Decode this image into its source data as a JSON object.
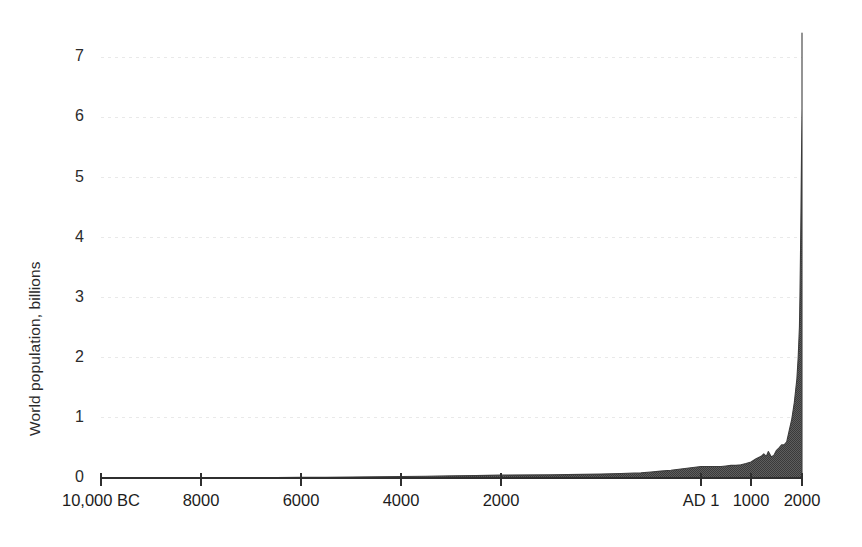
{
  "chart_data": {
    "type": "area",
    "title": "",
    "subtitle": "",
    "xlabel": "",
    "ylabel": "World population, billions",
    "ylim": [
      0,
      7.6
    ],
    "grid": true,
    "legend": null,
    "axis_scale_note": "piecewise x-axis: even spacing 10,000BC-2000BC, compressed AD1-2000",
    "y_ticks": [
      "0",
      "1",
      "2",
      "3",
      "4",
      "5",
      "6",
      "7"
    ],
    "y_tick_values": [
      0,
      1,
      2,
      3,
      4,
      5,
      6,
      7
    ],
    "x_ticks": [
      "10,000 BC",
      "8000",
      "6000",
      "4000",
      "2000",
      "AD 1",
      "1000",
      "2000"
    ],
    "x_tick_values": [
      -10000,
      -8000,
      -6000,
      -4000,
      -2000,
      1,
      1000,
      2000
    ],
    "series_name": "World population",
    "x": [
      -10000,
      -9500,
      -9000,
      -8500,
      -8000,
      -7500,
      -7000,
      -6500,
      -6000,
      -5500,
      -5000,
      -4500,
      -4000,
      -3500,
      -3000,
      -2500,
      -2000,
      -1500,
      -1000,
      -800,
      -600,
      -500,
      -400,
      -300,
      -200,
      -100,
      1,
      200,
      400,
      500,
      600,
      700,
      800,
      900,
      1000,
      1100,
      1200,
      1250,
      1300,
      1340,
      1400,
      1450,
      1500,
      1550,
      1600,
      1650,
      1700,
      1750,
      1800,
      1850,
      1900,
      1925,
      1950,
      1960,
      1970,
      1980,
      1990,
      2000,
      2011
    ],
    "values": [
      0.004,
      0.004,
      0.005,
      0.005,
      0.005,
      0.006,
      0.007,
      0.008,
      0.01,
      0.012,
      0.015,
      0.019,
      0.025,
      0.03,
      0.035,
      0.04,
      0.047,
      0.055,
      0.065,
      0.075,
      0.085,
      0.1,
      0.115,
      0.13,
      0.15,
      0.17,
      0.19,
      0.19,
      0.19,
      0.2,
      0.21,
      0.21,
      0.22,
      0.24,
      0.265,
      0.32,
      0.36,
      0.4,
      0.36,
      0.44,
      0.35,
      0.38,
      0.46,
      0.5,
      0.55,
      0.55,
      0.6,
      0.79,
      0.98,
      1.26,
      1.65,
      2.0,
      2.52,
      3.02,
      3.7,
      4.44,
      5.32,
      6.14,
      7.4
    ],
    "peak_value": 7.4,
    "peak_label": "2011",
    "fill_color": "#4a4a4a",
    "line_color": "#3c3c3c",
    "grid_color": "#e9e9e9",
    "axis_color": "#2f2f2f",
    "background_color": "#ffffff"
  }
}
